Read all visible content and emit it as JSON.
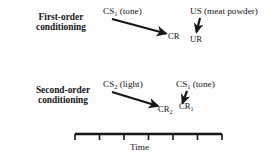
{
  "figure": {
    "type": "conceptual-diagram",
    "topic": "classical-conditioning",
    "background_color": "#fdfdfd",
    "ink_color": "#17171a"
  },
  "rows": [
    {
      "id": "first-order",
      "title_line1": "First-order",
      "title_line2": "conditioning",
      "stimulus": {
        "code": "CS",
        "subscript": "1",
        "modality": "(tone)"
      },
      "outcome": {
        "code": "US",
        "subscript": "",
        "modality": "(meat powder)"
      },
      "responses": [
        {
          "code": "CR",
          "subscript": ""
        },
        {
          "code": "UR",
          "subscript": ""
        }
      ]
    },
    {
      "id": "second-order",
      "title_line1": "Second-order",
      "title_line2": "conditioning",
      "stimulus": {
        "code": "CS",
        "subscript": "2",
        "modality": "(light)"
      },
      "outcome": {
        "code": "CS",
        "subscript": "1",
        "modality": "(tone)"
      },
      "responses": [
        {
          "code": "CR",
          "subscript": "2"
        },
        {
          "code": "CR",
          "subscript": "1"
        }
      ]
    }
  ],
  "axis": {
    "label": "Time",
    "tick_count": 6,
    "orientation": "horizontal"
  }
}
